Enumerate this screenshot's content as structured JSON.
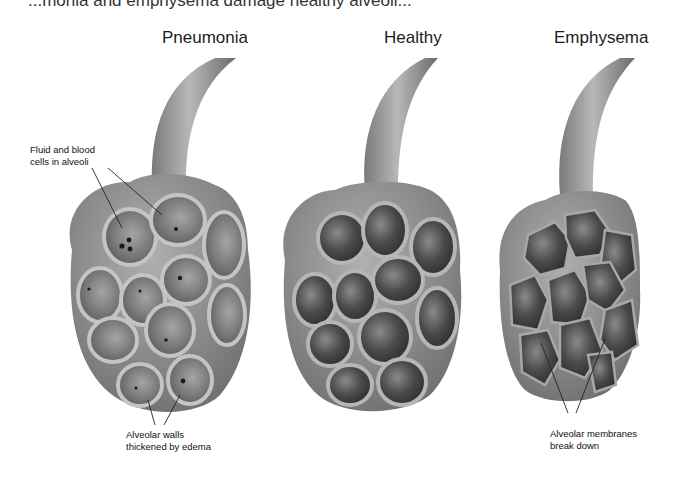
{
  "caption_partial": "...monia and emphysema damage healthy alveoli...",
  "panels": [
    {
      "title": "Pneumonia",
      "annotations": [
        "Fluid and blood\ncells in alveoli",
        "Alveolar walls\nthickened by edema"
      ]
    },
    {
      "title": "Healthy"
    },
    {
      "title": "Emphysema",
      "annotations": [
        "Alveolar membranes\nbreak down"
      ]
    }
  ],
  "labels": {
    "pneumonia_top_1": "Fluid and blood",
    "pneumonia_top_2": "cells in alveoli",
    "pneumonia_bottom_1": "Alveolar walls",
    "pneumonia_bottom_2": "thickened by edema",
    "emphysema_bottom_1": "Alveolar membranes",
    "emphysema_bottom_2": "break down"
  },
  "colors": {
    "wall": "#9a9a9a",
    "wall_light": "#bdbdbd",
    "cavity_dark": "#3e3e3e",
    "cavity_mid": "#6e6e6e",
    "pneumonia_cavity": "#7d7d7d",
    "dot": "#1a1a1a"
  }
}
